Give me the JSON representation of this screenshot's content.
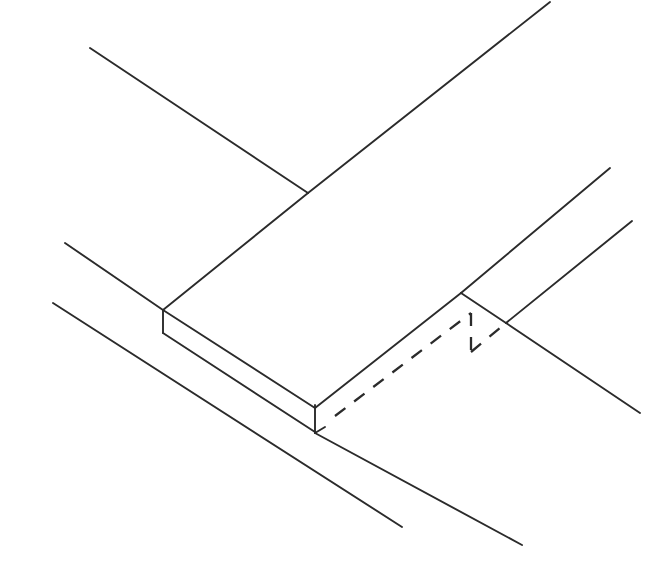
{
  "drawing": {
    "title": "Isometric Slab Edge Detail",
    "type": "technical-line-drawing",
    "projection": "isometric",
    "canvas": {
      "width": 670,
      "height": 572
    },
    "background_color": "#ffffff",
    "line_color": "#2b2b2b",
    "solid_stroke_width": 1.9,
    "hidden_stroke_width": 2.3,
    "hidden_dash_pattern": "13 11",
    "geometry": {
      "solid_edges": [
        {
          "name": "upper-left-extension-line",
          "points": "90,48 308,193"
        },
        {
          "name": "upper-right-extension-line",
          "points": "308,193 550,2"
        },
        {
          "name": "top-face-left-edge",
          "points": "308,193 163,310"
        },
        {
          "name": "slab-left-vertical-edge",
          "points": "163,310 163,333"
        },
        {
          "name": "slab-front-top-edge",
          "points": "163,310 315,408"
        },
        {
          "name": "slab-front-bottom-edge",
          "points": "163,333 315,432"
        },
        {
          "name": "slab-right-vertical-edge",
          "points": "315,405 315,433"
        },
        {
          "name": "slab-bottom-hook-tick",
          "points": "315,433 325,427"
        },
        {
          "name": "top-face-right-edge",
          "points": "315,408 461,293"
        },
        {
          "name": "upper-right-ledge-edge",
          "points": "461,293 610,168"
        },
        {
          "name": "ledge-step-edge",
          "points": "461,293 506,323"
        },
        {
          "name": "right-extension-upper",
          "points": "506,323 632,221"
        },
        {
          "name": "right-extension-lower",
          "points": "506,323 640,413"
        },
        {
          "name": "left-extension-mid",
          "points": "65,243 163,310"
        },
        {
          "name": "left-extension-lower",
          "points": "53,303 402,527"
        },
        {
          "name": "bottom-ground-line",
          "points": "315,433 522,545"
        }
      ],
      "hidden_edges": [
        {
          "name": "hidden-lower-slab-edge",
          "points": "335,416 471,313"
        },
        {
          "name": "hidden-vertical-edge",
          "points": "471,313 471,352"
        },
        {
          "name": "hidden-step-edge",
          "points": "471,352 506,323"
        }
      ]
    }
  }
}
